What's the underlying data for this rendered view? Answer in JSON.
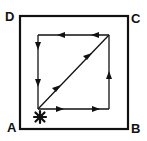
{
  "diagram": {
    "type": "path-on-square",
    "colors": {
      "stroke": "#111111",
      "background": "#ffffff"
    },
    "corners": [
      {
        "id": "A",
        "label": "A",
        "position": "bottom-left"
      },
      {
        "id": "B",
        "label": "B",
        "position": "bottom-right"
      },
      {
        "id": "C",
        "label": "C",
        "position": "top-right"
      },
      {
        "id": "D",
        "label": "D",
        "position": "top-left"
      }
    ],
    "start_marker": {
      "icon": "star-burst-icon",
      "position": "near-A"
    },
    "path": [
      {
        "from": "A",
        "to": "B",
        "direction": "right",
        "arrows": 2
      },
      {
        "from": "B",
        "to": "C",
        "direction": "up",
        "arrows": 1
      },
      {
        "from": "C",
        "to": "D",
        "direction": "left",
        "arrows": 2
      },
      {
        "from": "D",
        "to": "A",
        "direction": "down",
        "arrows": 2
      },
      {
        "from": "A",
        "to": "C",
        "direction": "diagonal-up-right",
        "arrows": 2
      }
    ]
  }
}
